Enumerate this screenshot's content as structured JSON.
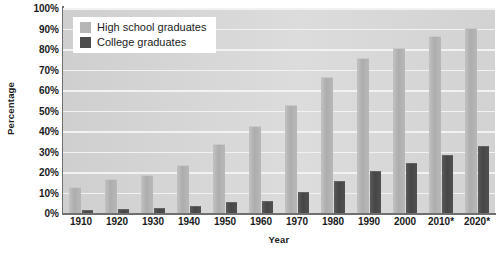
{
  "chart_data": {
    "type": "bar",
    "title": "",
    "xlabel": "Year",
    "ylabel": "Percentage",
    "categories": [
      "1910",
      "1920",
      "1930",
      "1940",
      "1950",
      "1960",
      "1970",
      "1980",
      "1990",
      "2000",
      "2010*",
      "2020*"
    ],
    "series": [
      {
        "name": "High school graduates",
        "color": "#b3b3b3",
        "values": [
          12,
          16,
          18,
          23,
          33,
          42,
          52,
          66,
          75,
          80,
          86,
          90
        ]
      },
      {
        "name": "College graduates",
        "color": "#4d4d4d",
        "values": [
          1,
          1.5,
          2,
          3,
          5,
          5.5,
          10,
          15,
          20,
          24,
          28,
          32
        ]
      }
    ],
    "ylim": [
      0,
      100
    ],
    "ytick_labels": [
      "0%",
      "10%",
      "20%",
      "30%",
      "40%",
      "50%",
      "60%",
      "70%",
      "80%",
      "90%",
      "100%"
    ],
    "ytick_values": [
      0,
      10,
      20,
      30,
      40,
      50,
      60,
      70,
      80,
      90,
      100
    ],
    "grid": true,
    "legend_position": "top-left",
    "plot_background": "#d6d6d6",
    "gridline_color": "#f2f2f2",
    "axis_color": "#6f6f6f"
  }
}
